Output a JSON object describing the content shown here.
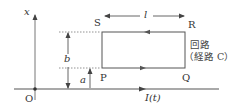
{
  "diagram": {
    "title": "",
    "colors": {
      "line": "#555555",
      "dashed": "#777777",
      "text": "#333333",
      "background": "#ffffff"
    },
    "axis": {
      "vertical_label": "x",
      "origin_label": "O"
    },
    "wire": {
      "current_label": "I(t)"
    },
    "loop": {
      "corners": {
        "top_left": "S",
        "top_right": "R",
        "bottom_left": "P",
        "bottom_right": "Q"
      },
      "name_line1": "回路",
      "name_line2": "（経路 C）",
      "width_label": "l",
      "height_label": "b",
      "offset_label": "a"
    }
  }
}
